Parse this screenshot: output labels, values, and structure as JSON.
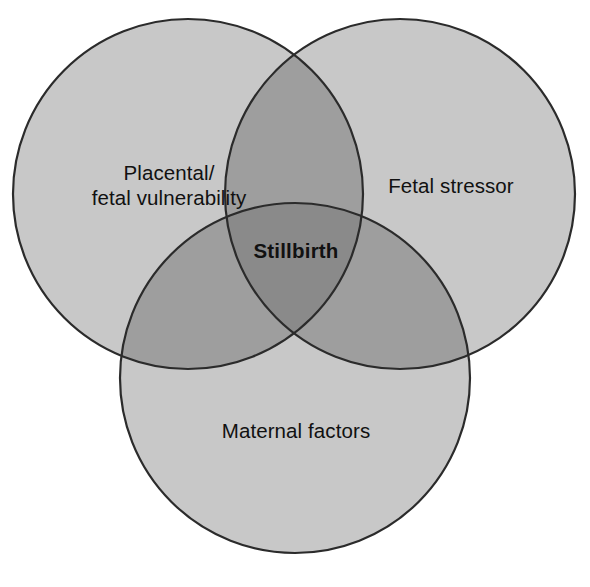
{
  "figure": {
    "type": "venn-diagram-3-set",
    "title": "",
    "background_color": "#ffffff"
  },
  "colors": {
    "circle_fill": "#c8c8c8",
    "overlap_two": "#9e9e9e",
    "overlap_three": "#8a8a8a",
    "stroke": "#2b2b2b",
    "text": "#111111"
  },
  "sets": [
    {
      "id": "placental-fetal-vulnerability",
      "label_line1": "Placental/",
      "label_line2": "fetal vulnerability",
      "label": "Placental/\nfetal vulnerability",
      "position": "top-left",
      "center_x": 188,
      "center_y": 194,
      "radius": 175
    },
    {
      "id": "fetal-stressor",
      "label": "Fetal stressor",
      "position": "top-right",
      "center_x": 400,
      "center_y": 194,
      "radius": 175
    },
    {
      "id": "maternal-factors",
      "label": "Maternal factors",
      "position": "bottom-center",
      "center_x": 295,
      "center_y": 378,
      "radius": 175
    }
  ],
  "intersection": {
    "id": "stillbirth",
    "label": "Stillbirth",
    "emphasis": "bold",
    "center_x": 295,
    "center_y": 250
  }
}
